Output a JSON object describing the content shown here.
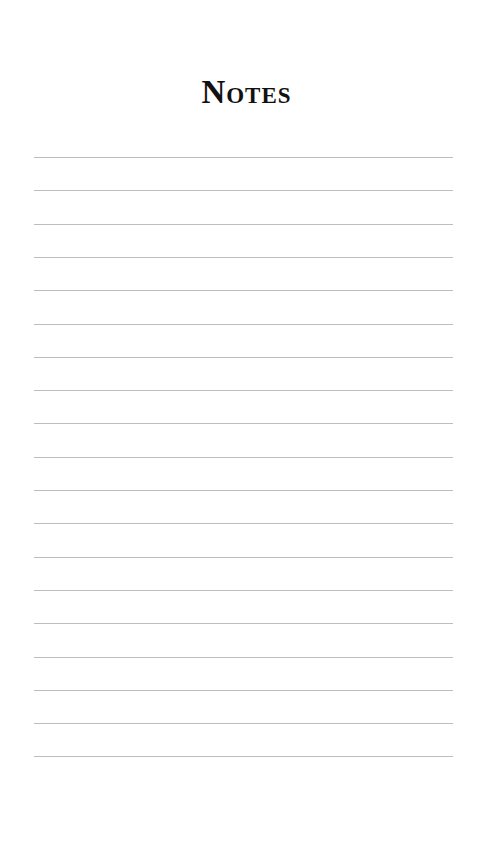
{
  "page": {
    "title": "Notes",
    "line_count": 19,
    "line_color": "#bdbdbd",
    "first_line_y": 157,
    "line_spacing": 33.3
  }
}
